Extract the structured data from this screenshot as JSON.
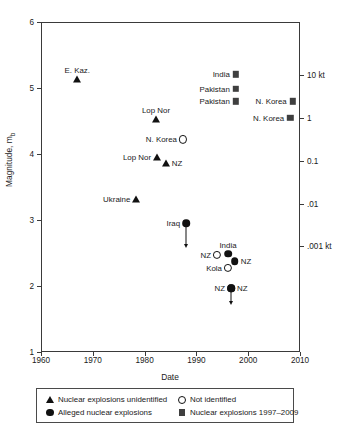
{
  "chart_data": {
    "type": "scatter",
    "title": "",
    "xlabel": "Date",
    "ylabel": "Magnitude, mb",
    "ylabel_base": "Magnitude, m",
    "ylabel_sub": "b",
    "xlim": [
      1960,
      2010
    ],
    "ylim": [
      1,
      6
    ],
    "xticks": [
      "1960",
      "1970",
      "1980",
      "1990",
      "2000",
      "2010"
    ],
    "xtick_values": [
      1960,
      1970,
      1980,
      1990,
      2000,
      2010
    ],
    "yticks": [
      "1",
      "2",
      "3",
      "4",
      "5",
      "6"
    ],
    "ytick_values": [
      1,
      2,
      3,
      4,
      5,
      6
    ],
    "y2label": "Yield",
    "y2ticks": [
      "10 kt",
      "1",
      "0.1",
      ".01",
      ".001 kt"
    ],
    "y2tick_mb": [
      5.2,
      4.55,
      3.9,
      3.25,
      2.6
    ],
    "grid": false,
    "legend_position": "below-axes",
    "series": [
      {
        "name": "Nuclear explosions unidentified",
        "marker": "triangle",
        "points": [
          {
            "label": "E. Kaz.",
            "label_side": "above",
            "x": 1967.0,
            "y": 5.13
          },
          {
            "label": "Lop Nor",
            "label_side": "above",
            "x": 1982.2,
            "y": 4.53
          },
          {
            "label": "Lop Nor",
            "label_side": "left",
            "x": 1982.4,
            "y": 3.96
          },
          {
            "label": "NZ",
            "label_side": "right",
            "x": 1984.1,
            "y": 3.87
          },
          {
            "label": "Ukraine",
            "label_side": "left",
            "x": 1978.4,
            "y": 3.32
          }
        ]
      },
      {
        "name": "Not identified",
        "marker": "circle-open",
        "points": [
          {
            "label": "N. Korea",
            "label_side": "left",
            "x": 1987.4,
            "y": 4.22
          },
          {
            "label": "NZ",
            "label_side": "left",
            "x": 1994.0,
            "y": 2.47
          },
          {
            "label": "Kola",
            "label_side": "left",
            "x": 1996.1,
            "y": 2.27
          }
        ]
      },
      {
        "name": "Alleged nuclear explosions",
        "marker": "circle-filled",
        "points": [
          {
            "label": "Iraq",
            "label_side": "left",
            "x": 1988.0,
            "y": 2.95,
            "arrow": "down",
            "arrow_to": 2.58
          },
          {
            "label": "India",
            "label_side": "above",
            "x": 1996.1,
            "y": 2.49
          },
          {
            "label": "NZ",
            "label_side": "right",
            "x": 1997.4,
            "y": 2.38
          },
          {
            "label": "NZ",
            "label_side": "left",
            "x": 1996.7,
            "y": 1.97,
            "arrow": "down",
            "arrow_to": 1.71
          },
          {
            "label": "NZ",
            "label_side": "right",
            "x": 1996.7,
            "y": 1.97
          }
        ]
      },
      {
        "name": "Nuclear explosions 1997–2009",
        "marker": "square",
        "points": [
          {
            "label": "India",
            "label_side": "left",
            "x": 1997.6,
            "y": 5.21
          },
          {
            "label": "Pakistan",
            "label_side": "left",
            "x": 1997.6,
            "y": 4.99
          },
          {
            "label": "Pakistan",
            "label_side": "left",
            "x": 1997.6,
            "y": 4.8
          },
          {
            "label": "N. Korea",
            "label_side": "left",
            "x": 2008.6,
            "y": 4.8
          },
          {
            "label": "N. Korea",
            "label_side": "left",
            "x": 2008.1,
            "y": 4.55
          }
        ]
      }
    ]
  },
  "legend": {
    "items": [
      {
        "symbol": "triangle",
        "label": "Nuclear explosions unidentified"
      },
      {
        "symbol": "circle-open",
        "label": "Not identified"
      },
      {
        "symbol": "circle-filled",
        "label": "Alleged nuclear explosions"
      },
      {
        "symbol": "square",
        "label": "Nuclear explosions 1997–2009"
      }
    ]
  },
  "colors": {
    "marker": "#111111",
    "square_marker": "#3f3f3f",
    "axis": "#3a3a3a",
    "text": "#1a1a1a",
    "background": "#ffffff"
  }
}
